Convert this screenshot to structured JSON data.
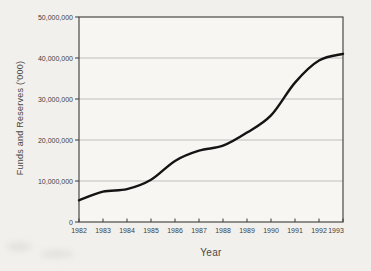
{
  "page": {
    "background_color": "#f2f0ed",
    "plot_background_color": "#f7f6f3"
  },
  "chart_data": {
    "type": "line",
    "title": "",
    "xlabel": "Year",
    "ylabel": "Funds and Reserves ('000)",
    "x": [
      1982,
      1983,
      1984,
      1985,
      1986,
      1987,
      1988,
      1989,
      1990,
      1991,
      1992,
      1993
    ],
    "series": [
      {
        "name": "Funds and Reserves",
        "color": "#141414",
        "values": [
          5300000,
          7400000,
          8000000,
          10300000,
          14900000,
          17400000,
          18600000,
          21800000,
          26000000,
          34000000,
          39400000,
          41000000
        ]
      }
    ],
    "ylim": [
      0,
      50000000
    ],
    "ytick_interval": 10000000,
    "ytick_labels": [
      "0",
      "10,000,000",
      "20,000,000",
      "30,000,000",
      "40,000,000",
      "50,000,000"
    ],
    "grid": "horizontal",
    "gridline_color": "#b3b1ad",
    "axis_color": "#3c3a38",
    "legend": "none",
    "markers": "none"
  }
}
